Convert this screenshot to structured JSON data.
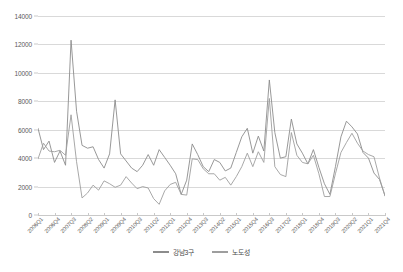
{
  "chart_data": {
    "type": "line",
    "title": "",
    "xlabel": "",
    "ylabel": "",
    "ylim": [
      0,
      14000
    ],
    "ytick_values": [
      0,
      2000,
      4000,
      6000,
      8000,
      10000,
      12000,
      14000
    ],
    "ytick_labels": [
      "0",
      "2000",
      "4000",
      "6000",
      "8000",
      "10000",
      "12000",
      "14000"
    ],
    "grid": true,
    "legend_position": "bottom-center",
    "xtick_label_rotation": -45,
    "xtick_label_step": 3,
    "categories": [
      "2006Q1",
      "2006Q2",
      "2006Q3",
      "2006Q4",
      "2007Q1",
      "2007Q2",
      "2007Q3",
      "2007Q4",
      "2008Q1",
      "2008Q2",
      "2008Q3",
      "2008Q4",
      "2009Q1",
      "2009Q2",
      "2009Q3",
      "2009Q4",
      "2010Q1",
      "2010Q2",
      "2010Q3",
      "2010Q4",
      "2011Q1",
      "2011Q2",
      "2011Q3",
      "2011Q4",
      "2012Q1",
      "2012Q2",
      "2012Q3",
      "2012Q4",
      "2013Q1",
      "2013Q2",
      "2013Q3",
      "2013Q4",
      "2014Q1",
      "2014Q2",
      "2014Q3",
      "2014Q4",
      "2015Q1",
      "2015Q2",
      "2015Q3",
      "2015Q4",
      "2016Q1",
      "2016Q2",
      "2016Q3",
      "2016Q4",
      "2017Q1",
      "2017Q2",
      "2017Q3",
      "2017Q4",
      "2018Q1",
      "2018Q2",
      "2018Q3",
      "2018Q4",
      "2019Q1",
      "2019Q2",
      "2019Q3",
      "2019Q4",
      "2020Q1",
      "2020Q2",
      "2020Q3",
      "2020Q4",
      "2021Q1",
      "2021Q2",
      "2021Q3",
      "2021Q4"
    ],
    "displayed_xtick_labels": [
      "2006Q1",
      "2006Q4",
      "2007Q3",
      "2008Q2",
      "2009Q1",
      "2009Q4",
      "2010Q3",
      "2011Q2",
      "2012Q1",
      "2012Q4",
      "2013Q3",
      "2014Q2",
      "2015Q1",
      "2015Q4",
      "2016Q3",
      "2017Q2",
      "2018Q1",
      "2018Q4",
      "2019Q3",
      "2020Q2",
      "2021Q1",
      "2021Q4"
    ],
    "series": [
      {
        "name": "강남3구",
        "color": "#8c8c8c",
        "values": [
          6100,
          4600,
          5200,
          3700,
          4500,
          3500,
          12300,
          7300,
          4900,
          4700,
          4800,
          3900,
          3300,
          4300,
          8100,
          4300,
          3800,
          3300,
          3050,
          3500,
          4250,
          3500,
          4600,
          4050,
          3500,
          2900,
          1450,
          2450,
          5000,
          4250,
          3400,
          3050,
          3900,
          3700,
          3100,
          3300,
          4400,
          5500,
          6100,
          4350,
          5550,
          4500,
          9500,
          5800,
          4000,
          4100,
          6750,
          5000,
          4350,
          3600,
          4600,
          3350,
          2200,
          1450,
          3400,
          5500,
          6600,
          6200,
          5700,
          4400,
          4000,
          2950,
          2500,
          1350
        ]
      },
      {
        "name": "노도성",
        "color": "#9e9e9e",
        "values": [
          3950,
          5050,
          4500,
          4450,
          4550,
          4200,
          7050,
          3750,
          1200,
          1550,
          2100,
          1750,
          2400,
          2200,
          1950,
          2100,
          2700,
          2250,
          1850,
          2000,
          1900,
          1150,
          750,
          1700,
          2150,
          2300,
          1450,
          1400,
          3950,
          3900,
          3250,
          2900,
          2900,
          2450,
          2650,
          2100,
          2700,
          3400,
          4350,
          3400,
          4450,
          3700,
          8200,
          3400,
          2850,
          2700,
          5800,
          4200,
          3700,
          3600,
          4200,
          2900,
          1300,
          1300,
          2900,
          4400,
          5100,
          5750,
          5050,
          4500,
          4250,
          4100,
          2600,
          1350
        ]
      }
    ]
  },
  "legend": {
    "items": [
      {
        "label": "강남3구",
        "color": "#8c8c8c"
      },
      {
        "label": "노도성",
        "color": "#9e9e9e"
      }
    ]
  }
}
